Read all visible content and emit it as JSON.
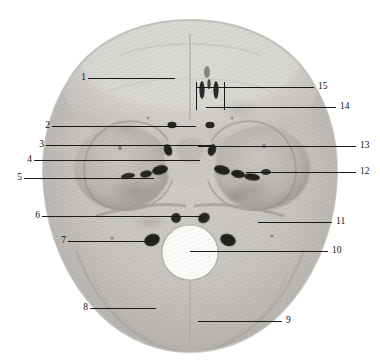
{
  "figure": {
    "kind": "anatomical-photograph",
    "background_color": "#ffffff",
    "bone_light": "#d8d6d2",
    "bone_mid": "#b9b6b1",
    "bone_dark": "#8d8a86",
    "foramen_color": "#1b1b1b",
    "leader_color": "#1a1a1a",
    "label_color": "#111111"
  },
  "labels": {
    "left": [
      {
        "num": "1",
        "x": 82,
        "y": 78,
        "line_to": 175,
        "tick": false
      },
      {
        "num": "2",
        "x": 46,
        "y": 126,
        "line_to": 196,
        "tick": false
      },
      {
        "num": "3",
        "x": 40,
        "y": 145,
        "line_to": 214,
        "tick": false
      },
      {
        "num": "4",
        "x": 28,
        "y": 160,
        "line_to": 200,
        "tick": false
      },
      {
        "num": "5",
        "x": 18,
        "y": 178,
        "line_to": 154,
        "tick": false
      },
      {
        "num": "6",
        "x": 36,
        "y": 216,
        "line_to": 206,
        "tick": false
      },
      {
        "num": "7",
        "x": 62,
        "y": 241,
        "line_to": 152,
        "tick": false
      },
      {
        "num": "8",
        "x": 84,
        "y": 308,
        "line_to": 156,
        "tick": false
      }
    ],
    "right": [
      {
        "num": "15",
        "x": 318,
        "y": 87,
        "line_to": 196,
        "tick": true,
        "tick_y0": 82,
        "tick_y1": 110
      },
      {
        "num": "14",
        "x": 340,
        "y": 107,
        "line_to": 206,
        "tick": false
      },
      {
        "num": "13",
        "x": 360,
        "y": 146,
        "line_to": 227,
        "tick": false
      },
      {
        "num": "12",
        "x": 360,
        "y": 172,
        "line_to": 246,
        "tick": false
      },
      {
        "num": "11",
        "x": 336,
        "y": 222,
        "line_to": 258,
        "tick": false
      },
      {
        "num": "10",
        "x": 332,
        "y": 251,
        "line_to": 216,
        "tick": false
      },
      {
        "num": "9",
        "x": 286,
        "y": 321,
        "line_to": 198,
        "tick": false
      }
    ]
  },
  "caption": {
    "visible": false,
    "text": ""
  }
}
